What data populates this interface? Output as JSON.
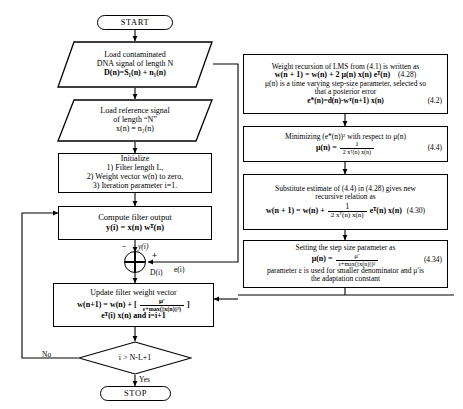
{
  "diagram": {
    "type": "flowchart"
  },
  "left_column": {
    "start": {
      "label": "START",
      "shape": "terminator"
    },
    "load_contaminated": {
      "shape": "parallelogram",
      "line1": "Load contaminated",
      "line2": "DNA signal  of length N",
      "line3": "D(n)=S₁(n) + n₁(n)"
    },
    "load_reference": {
      "shape": "parallelogram",
      "line1": "Load reference signal",
      "line2": "of length “N”",
      "line3": "x(n) = n₂(n)"
    },
    "initialize": {
      "shape": "process",
      "line1": "Initialize",
      "line2": "1) Filter  length  L,",
      "line3": "2) Weight  vector w(n) to zero,",
      "line4": "3) Iteration  parameter  i=1."
    },
    "compute_output": {
      "shape": "process",
      "line1": "Compute  filter output",
      "line2": "y(i)  = x(n) wᵀ(n)"
    },
    "summation": {
      "shape": "summing-junction",
      "minus_sign": "−",
      "plus_sign": "+",
      "input_y": "y(i)",
      "input_d": "D(i)",
      "output_e": "e(i)"
    },
    "update_weights": {
      "shape": "process",
      "line1": "Update filter  weight  vector",
      "eq_prefix": "w(n+1) = w(n) + [",
      "eq_frac_num": "μ′",
      "eq_frac_den": "ε+max(||x(n)||²)",
      "eq_suffix": "]",
      "line3": "eᵀ(i) x(n) and i=i+1"
    },
    "decision": {
      "shape": "diamond",
      "label": "i > N-L+1",
      "branch_no": "No",
      "branch_yes": "Yes"
    },
    "stop": {
      "label": "STOP",
      "shape": "terminator"
    }
  },
  "right_column": {
    "box1": {
      "line1": "Weight recursion of LMS from (4.1) is written as",
      "eq1": "w(n + 1) = w(n) + 2 μ(n) x(n) eᵀ(n)",
      "eq1_tag": "(4.28)",
      "line3": "μ(n) is a time varying step-size parameter, selected so",
      "line4": "that a posterior  error",
      "eq2": "e*(n)=d(n)-wᵀ(n+1)  x(n)",
      "eq2_tag": "(4.2)"
    },
    "box2": {
      "line1": "Minimizing  (e*(n))² with  respect to μ(n)",
      "eq_lhs": "μ(n) =",
      "eq_num": "1",
      "eq_den": "2 xᵀ(n) x(n)",
      "tag": "(4.4)"
    },
    "box3": {
      "line1": "Substitute  estimate of (4.4) in (4.28) gives new",
      "line2": "recursive relation as",
      "eq_lhs": "w(n + 1) = w(n) +",
      "eq_num": "1",
      "eq_den": "2 xᵀ(n) x(n)",
      "eq_rhs": "eᵀ(n) x(n)",
      "tag": "(4.30)"
    },
    "box4": {
      "line1": "Setting  the  step size  parameter as",
      "eq_lhs": "μ(n) =",
      "eq_num": "μ′",
      "eq_den": "ε+max(||x(n)||)²",
      "tag": "(4.34)",
      "line3": "parameter ε is used for smaller denominator  and μ′is",
      "line4": "the adaptation constant"
    }
  },
  "colors": {
    "stroke": "#000000",
    "background": "#ffffff"
  }
}
